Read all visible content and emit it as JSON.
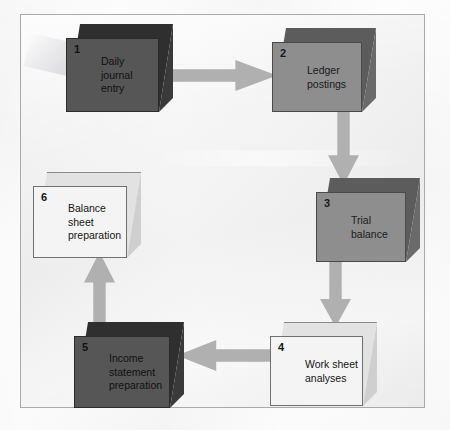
{
  "diagram": {
    "frame": {
      "visible": true,
      "border_color": "#a9a9a9",
      "background": "#f2f2f2"
    },
    "arrow_color": "#b0b0b0",
    "shades": {
      "dark": "#565656",
      "mid": "#8e8e8e",
      "light": "#f4f4f4"
    },
    "nodes": [
      {
        "id": "node-1",
        "number": "1",
        "label": "Daily\njournal\nentry",
        "shade": "dark"
      },
      {
        "id": "node-2",
        "number": "2",
        "label": "Ledger\npostings",
        "shade": "mid"
      },
      {
        "id": "node-3",
        "number": "3",
        "label": "Trial\nbalance",
        "shade": "mid"
      },
      {
        "id": "node-4",
        "number": "4",
        "label": "Work sheet\nanalyses",
        "shade": "light"
      },
      {
        "id": "node-5",
        "number": "5",
        "label": "Income\nstatement\npreparation",
        "shade": "dark"
      },
      {
        "id": "node-6",
        "number": "6",
        "label": "Balance\nsheet\npreparation",
        "shade": "light"
      }
    ],
    "connectors": [
      {
        "id": "arrow-1-to-2",
        "from": "1",
        "to": "2",
        "direction": "right"
      },
      {
        "id": "arrow-2-to-3",
        "from": "2",
        "to": "3",
        "direction": "down"
      },
      {
        "id": "arrow-3-to-4",
        "from": "3",
        "to": "4",
        "direction": "down"
      },
      {
        "id": "arrow-4-to-5",
        "from": "4",
        "to": "5",
        "direction": "left"
      },
      {
        "id": "arrow-5-to-6",
        "from": "5",
        "to": "6",
        "direction": "up"
      }
    ]
  }
}
